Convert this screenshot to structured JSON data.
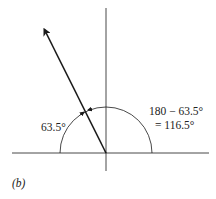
{
  "figure": {
    "panel_label": "(b)",
    "vector_angle_label": "63.5°",
    "supplement_line1": "180 − 63.5°",
    "supplement_line2": "= 116.5°",
    "vector_angle_deg": 116.5,
    "reference_angle_deg": 63.5,
    "colors": {
      "stroke": "#1a1a1a",
      "text": "#222222"
    }
  }
}
